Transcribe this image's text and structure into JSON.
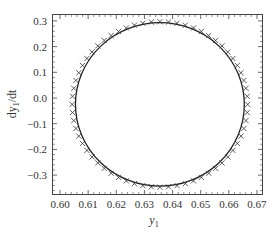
{
  "chart_data": {
    "type": "scatter",
    "title": "",
    "xlabel": "y1",
    "ylabel": "dy1/dt",
    "xlim": [
      0.5985,
      0.6715
    ],
    "ylim": [
      -0.375,
      0.33
    ],
    "xticks": [
      0.6,
      0.61,
      0.62,
      0.63,
      0.64,
      0.65,
      0.66,
      0.67
    ],
    "xtick_labels": [
      "0.60",
      "0.61",
      "0.62",
      "0.63",
      "0.64",
      "0.65",
      "0.66",
      "0.67"
    ],
    "yticks": [
      0.3,
      0.2,
      0.1,
      0.0,
      -0.1,
      -0.2,
      -0.3
    ],
    "ytick_labels": [
      "0.3",
      "0.2",
      "0.1",
      "0.0",
      "−0.1",
      "−0.2",
      "−0.3"
    ],
    "grid": false,
    "legend": null,
    "series": [
      {
        "name": "solution curve",
        "style": "solid line",
        "shape": "closed orbit (limit cycle)",
        "center": [
          0.6355,
          -0.025
        ],
        "semi_axes": [
          0.03,
          0.318
        ],
        "x_range": [
          0.6055,
          0.6655
        ],
        "y_range": [
          -0.343,
          0.293
        ]
      },
      {
        "name": "reference points",
        "style": "x markers",
        "marker_count": 64,
        "center": [
          0.6355,
          -0.025
        ],
        "semi_axes": [
          0.0312,
          0.322
        ],
        "x_range": [
          0.6043,
          0.6667
        ],
        "y_range": [
          -0.347,
          0.297
        ]
      }
    ]
  },
  "axes": {
    "xlabel_main": "y",
    "xlabel_sub": "1",
    "ylabel_prefix": "dy",
    "ylabel_sub": "1",
    "ylabel_suffix": "/dt"
  }
}
